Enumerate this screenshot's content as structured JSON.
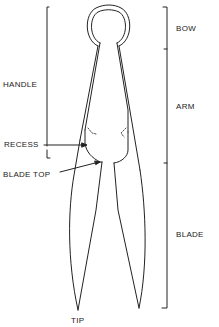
{
  "diagram": {
    "line_color": "#222222",
    "background": "#ffffff"
  },
  "labels": {
    "bow": "BOW",
    "arm": "ARM",
    "blade": "BLADE",
    "handle": "HANDLE",
    "recess": "RECESS",
    "blade_top": "BLADE TOP",
    "tip": "TIP"
  }
}
